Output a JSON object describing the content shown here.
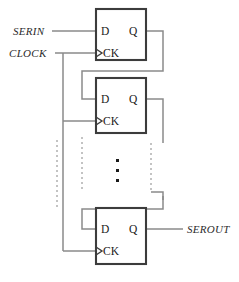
{
  "diagram": {
    "type": "logic-circuit",
    "background_color": "#ffffff",
    "wire_color": "#8a8a8a",
    "dashed_wire_color": "#b0b0b0",
    "box_stroke_color": "#3c3c3c",
    "text_color": "#1a1a1a",
    "io_labels": {
      "serial_in": "SERIN",
      "clock": "CLOCK",
      "serial_out": "SEROUT"
    },
    "pin_labels": {
      "d": "D",
      "q": "Q",
      "ck": "CK"
    },
    "flipflops": [
      {
        "id": "ff1",
        "d": "D",
        "q": "Q",
        "ck": "CK"
      },
      {
        "id": "ff2",
        "d": "D",
        "q": "Q",
        "ck": "CK"
      },
      {
        "id": "ff3",
        "d": "D",
        "q": "Q",
        "ck": "CK"
      }
    ],
    "continuation": "⋮"
  }
}
